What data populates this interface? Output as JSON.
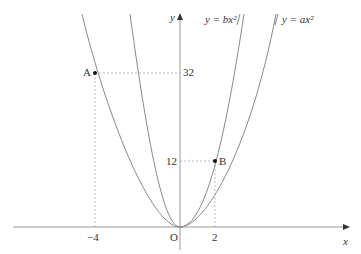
{
  "diagram": {
    "axes": {
      "x_label": "x",
      "y_label": "y",
      "origin_label": "O"
    },
    "curves": [
      {
        "id": "inner",
        "label": "y = bx²",
        "equation": "y=bx^2"
      },
      {
        "id": "outer",
        "label": "y = ax²",
        "equation": "y=ax^2"
      }
    ],
    "points": [
      {
        "name": "A",
        "x": -4,
        "y": 32
      },
      {
        "name": "B",
        "x": 2,
        "y": 12
      }
    ],
    "ticks": {
      "x": [
        "−4",
        "2"
      ],
      "y": [
        "32",
        "12"
      ]
    },
    "colors": {
      "curve": "#8a8a8a",
      "axis": "#9a9a9a",
      "dashed": "#aaaaaa",
      "point": "#111111"
    }
  }
}
